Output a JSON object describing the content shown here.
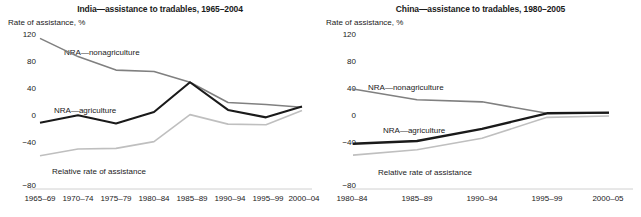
{
  "figure": {
    "background": "#ffffff",
    "text_color": "#1a1a1a",
    "series_colors": {
      "nra_agriculture": "#1a1a1a",
      "nra_nonagriculture": "#808080",
      "relative_rate": "#bfbfbf"
    }
  },
  "chart_data": [
    {
      "type": "line",
      "title": "India—assistance to tradables, 1965–2004",
      "ylabel": "Rate of assistance, %",
      "xlabel": "",
      "ylim": [
        -80,
        120
      ],
      "yticks": [
        "120",
        "80",
        "40",
        "0",
        "−40",
        "−80"
      ],
      "ytick_values": [
        120,
        80,
        40,
        0,
        -40,
        -80
      ],
      "grid": false,
      "legend": "inline-labels",
      "categories": [
        "1965–69",
        "1970–74",
        "1975–79",
        "1980–84",
        "1985–89",
        "1990–94",
        "1995–99",
        "2000–04"
      ],
      "series": [
        {
          "name": "NRA—nonagriculture",
          "color": "#808080",
          "values": [
            115,
            88,
            68,
            66,
            50,
            20,
            17,
            13
          ]
        },
        {
          "name": "NRA—agriculture",
          "color": "#1a1a1a",
          "values": [
            -10,
            1,
            -11,
            6,
            50,
            9,
            -2,
            14
          ]
        },
        {
          "name": "Relative rate of assistance",
          "color": "#bfbfbf",
          "values": [
            -59,
            -49,
            -48,
            -38,
            2,
            -12,
            -13,
            8
          ]
        }
      ]
    },
    {
      "type": "line",
      "title": "China—assistance to tradables, 1980–2005",
      "ylabel": "Rate of assistance, %",
      "xlabel": "",
      "ylim": [
        -80,
        120
      ],
      "yticks": [
        "120",
        "80",
        "40",
        "0",
        "−40",
        "−80"
      ],
      "ytick_values": [
        120,
        80,
        40,
        0,
        -40,
        -80
      ],
      "grid": false,
      "legend": "inline-labels",
      "categories": [
        "1980–84",
        "1985–89",
        "1990–94",
        "1995–99",
        "2000–05"
      ],
      "series": [
        {
          "name": "NRA—nonagriculture",
          "color": "#808080",
          "values": [
            40,
            24,
            21,
            4,
            4
          ]
        },
        {
          "name": "NRA—agriculture",
          "color": "#1a1a1a",
          "values": [
            -41,
            -37,
            -19,
            4,
            5
          ]
        },
        {
          "name": "Relative rate of assistance",
          "color": "#bfbfbf",
          "values": [
            -58,
            -50,
            -33,
            -2,
            0
          ]
        }
      ]
    }
  ],
  "panels": {
    "india": {
      "title": "India—assistance to tradables, 1965–2004",
      "axis_caption": "Rate of assistance, %",
      "yticks": [
        "120",
        "80",
        "40",
        "0",
        "−40",
        "−80"
      ],
      "xticks": [
        "1965–69",
        "1970–74",
        "1975–79",
        "1980–84",
        "1985–89",
        "1990–94",
        "1995–99",
        "2000–04"
      ],
      "series_labels": {
        "nonagriculture": "NRA—nonagriculture",
        "agriculture": "NRA—agriculture",
        "relative": "Relative rate of assistance"
      }
    },
    "china": {
      "title": "China—assistance to tradables, 1980–2005",
      "axis_caption": "Rate of assistance, %",
      "yticks": [
        "120",
        "80",
        "40",
        "0",
        "−40",
        "−80"
      ],
      "xticks": [
        "1980–84",
        "1985–89",
        "1990–94",
        "1995–99",
        "2000–05"
      ],
      "series_labels": {
        "nonagriculture": "NRA—nonagriculture",
        "agriculture": "NRA—agriculture",
        "relative": "Relative rate of assistance"
      }
    }
  }
}
